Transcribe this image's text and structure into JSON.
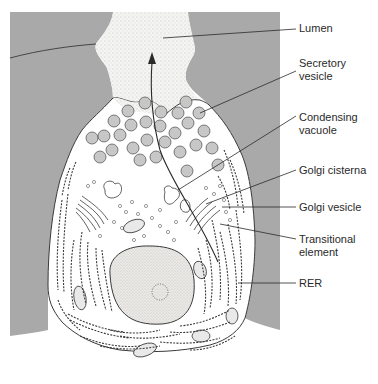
{
  "diagram": {
    "colors": {
      "tissue_gray": "#a9a9a9",
      "lumen_fill": "#f3f3f1",
      "outline": "#3a3a3a",
      "vesicle_fill": "#c7c7c7",
      "nucleus_fill": "#ecebe8"
    },
    "labels": [
      {
        "id": "lumen",
        "text": "Lumen"
      },
      {
        "id": "secretory-vesicle",
        "text": "Secretory\nvesicle"
      },
      {
        "id": "condensing-vacuole",
        "text": "Condensing\nvacuole"
      },
      {
        "id": "golgi-cisterna",
        "text": "Golgi cisterna"
      },
      {
        "id": "golgi-vesicle",
        "text": "Golgi vesicle"
      },
      {
        "id": "transitional-element",
        "text": "Transitional\nelement"
      },
      {
        "id": "rer",
        "text": "RER"
      }
    ],
    "arrow": {
      "meaning": "secretory pathway direction",
      "direction": "up toward lumen"
    }
  }
}
